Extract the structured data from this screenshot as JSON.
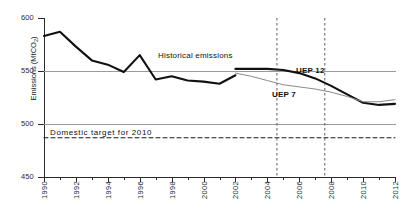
{
  "chart_data": {
    "type": "line",
    "title": "",
    "xlabel": "",
    "ylabel": "Emissions (MtCO2)",
    "ylabel_text": "Emissions (MtCO",
    "ylabel_sub": "2",
    "ylabel_tail": ")",
    "xlim": [
      1990,
      2012
    ],
    "ylim": [
      450,
      600
    ],
    "grid": "horizontal gridlines at 500 and 550",
    "legend": "inline annotations",
    "y_ticks": [
      600,
      550,
      500,
      450
    ],
    "y_tick_labels": [
      "600",
      "550",
      "500",
      "450"
    ],
    "x_ticks": [
      1990,
      1992,
      1994,
      1996,
      1998,
      2000,
      2002,
      2004,
      2006,
      2008,
      2010,
      2012
    ],
    "x_tick_labels": [
      "1990",
      "1992",
      "1994",
      "1996",
      "1998",
      "2000",
      "2002",
      "2004",
      "2006",
      "2008",
      "2010",
      "2012"
    ],
    "x_minor_ticks": [
      1991,
      1993,
      1995,
      1997,
      1999,
      2001,
      2003,
      2005,
      2007,
      2009,
      2011
    ],
    "series": [
      {
        "name": "Historical emissions",
        "style": "solid-thick-black",
        "color": "#111111",
        "x": [
          1990,
          1991,
          1992,
          1993,
          1994,
          1995,
          1996,
          1997,
          1998,
          1999,
          2000,
          2001,
          2002
        ],
        "values": [
          583,
          587,
          573,
          560,
          556,
          549,
          565,
          542,
          545,
          541,
          540,
          538,
          546
        ]
      },
      {
        "name": "UEP 12",
        "style": "solid-thick-black",
        "color": "#111111",
        "x": [
          2002,
          2003,
          2004,
          2005,
          2006,
          2007,
          2008,
          2009,
          2010,
          2011,
          2012
        ],
        "values": [
          552,
          552,
          552,
          551,
          548,
          543,
          536,
          528,
          520,
          518,
          519
        ]
      },
      {
        "name": "UEP 7",
        "style": "solid-thin-grey",
        "color": "#8a8a8a",
        "x": [
          2002,
          2003,
          2004,
          2005,
          2006,
          2007,
          2008,
          2009,
          2010,
          2011,
          2012
        ],
        "values": [
          548,
          545,
          541,
          537,
          535,
          533,
          530,
          526,
          521,
          521,
          523
        ]
      },
      {
        "name": "Domestic target for 2010",
        "style": "dashed-black-horizontal",
        "color": "#1a1a1a",
        "x": [
          1990,
          2012
        ],
        "values": [
          487,
          487
        ]
      }
    ],
    "vertical_markers": [
      {
        "name": "marker-2004",
        "x": 2004.6,
        "style": "dashed"
      },
      {
        "name": "marker-2007",
        "x": 2007.6,
        "style": "dashed"
      }
    ],
    "annotations": [
      {
        "name": "historical-emissions",
        "text": "Historical emissions",
        "x": 1999,
        "y": 563
      },
      {
        "name": "uep-12",
        "text": "UEP 12",
        "x": 2007.5,
        "y": 552
      },
      {
        "name": "uep-7",
        "text": "UEP 7",
        "x": 2006.0,
        "y": 530
      },
      {
        "name": "domestic-target",
        "text": "Domestic target for 2010",
        "x": 1990.5,
        "y": 496
      }
    ]
  },
  "colors": {
    "historical": "#111111",
    "uep12": "#111111",
    "uep7": "#8a8a8a",
    "grid": "#9a9a9a",
    "axis": "#2b2b2b",
    "background": "#ffffff"
  }
}
